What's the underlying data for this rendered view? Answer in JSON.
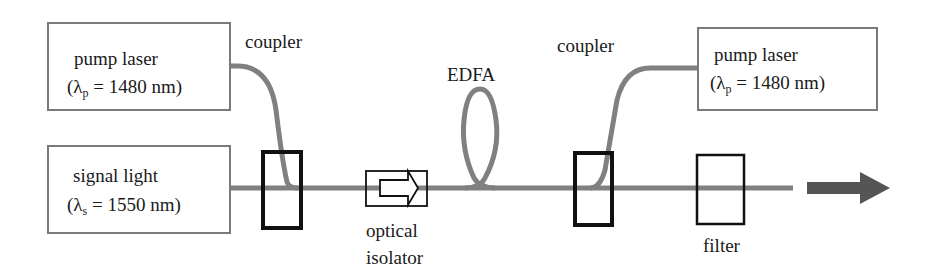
{
  "diagram": {
    "colors": {
      "fiber": "#808080",
      "coupler_border": "#111111",
      "box_border": "#7a7a7a",
      "arrow": "#555555",
      "text": "#1a1a1a"
    },
    "nodes": {
      "pump_left": {
        "line1": "pump laser",
        "lambda_symbol": "λ",
        "lambda_sub": "p",
        "lambda_rest": " = 1480 nm)",
        "open": "("
      },
      "signal": {
        "line1": "signal light",
        "lambda_symbol": "λ",
        "lambda_sub": "s",
        "lambda_rest": " = 1550 nm)",
        "open": "("
      },
      "pump_right": {
        "line1": "pump laser",
        "lambda_symbol": "λ",
        "lambda_sub": "p",
        "lambda_rest": " = 1480 nm)",
        "open": "("
      }
    },
    "labels": {
      "coupler_left": "coupler",
      "edfa": "EDFA",
      "coupler_right": "coupler",
      "isolator_line1": "optical",
      "isolator_line2": "isolator",
      "filter": "filter"
    },
    "components": [
      "pump laser (left)",
      "signal light",
      "coupler (left)",
      "optical isolator",
      "EDFA",
      "coupler (right)",
      "pump laser (right)",
      "filter",
      "output arrow"
    ]
  }
}
